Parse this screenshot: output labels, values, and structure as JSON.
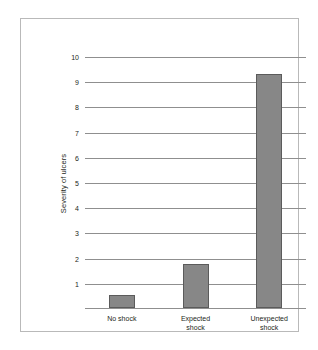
{
  "chart_data": {
    "type": "bar",
    "title": "",
    "subtitle": "",
    "xlabel": "",
    "ylabel": "Severity of ulcers",
    "categories": [
      "No shock",
      "Expected\nshock",
      "Unexpected\nshock"
    ],
    "values": [
      0.5,
      1.75,
      9.3
    ],
    "ylim": [
      0,
      10
    ],
    "ytick_labels": [
      "10",
      "9",
      "8",
      "7",
      "6",
      "5",
      "4",
      "3",
      "2",
      "1"
    ],
    "yticks": [
      10,
      9,
      8,
      7,
      6,
      5,
      4,
      3,
      2,
      1
    ],
    "grid": true,
    "legend": false,
    "bar_color": "#878787",
    "bar_edge_color": "#5b5b5b",
    "gridline_color": "#8f8f8f",
    "axis_color": "#8f8f8f",
    "frame_color": "#b9b9b9",
    "background_color": "#ffffff",
    "text_color": "#231f20"
  }
}
